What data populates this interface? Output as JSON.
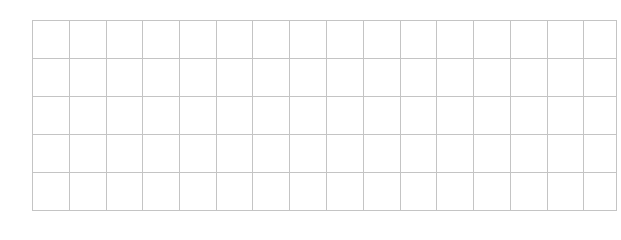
{
  "grid": {
    "rows": 5,
    "columns": 16,
    "column_widths": [
      37,
      37,
      36,
      37,
      37,
      36,
      37,
      37,
      37,
      37,
      36,
      37,
      37,
      37,
      36,
      33
    ],
    "row_height": 38,
    "line_color": "#c4c4c4",
    "background": "#ffffff",
    "cells": [
      [
        "",
        "",
        "",
        "",
        "",
        "",
        "",
        "",
        "",
        "",
        "",
        "",
        "",
        "",
        "",
        ""
      ],
      [
        "",
        "",
        "",
        "",
        "",
        "",
        "",
        "",
        "",
        "",
        "",
        "",
        "",
        "",
        "",
        ""
      ],
      [
        "",
        "",
        "",
        "",
        "",
        "",
        "",
        "",
        "",
        "",
        "",
        "",
        "",
        "",
        "",
        ""
      ],
      [
        "",
        "",
        "",
        "",
        "",
        "",
        "",
        "",
        "",
        "",
        "",
        "",
        "",
        "",
        "",
        ""
      ],
      [
        "",
        "",
        "",
        "",
        "",
        "",
        "",
        "",
        "",
        "",
        "",
        "",
        "",
        "",
        "",
        ""
      ]
    ]
  }
}
